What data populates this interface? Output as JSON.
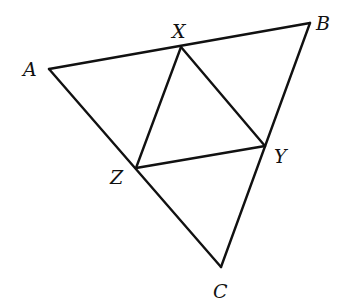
{
  "diagram": {
    "type": "geometry-triangle",
    "stroke_color": "#111111",
    "background": "#ffffff",
    "points": {
      "A": {
        "x": 49,
        "y": 69
      },
      "B": {
        "x": 310,
        "y": 23
      },
      "C": {
        "x": 221,
        "y": 267
      },
      "X": {
        "x": 181,
        "y": 47
      },
      "Y": {
        "x": 265,
        "y": 146
      },
      "Z": {
        "x": 136,
        "y": 168
      }
    },
    "segments": [
      [
        "A",
        "B"
      ],
      [
        "B",
        "C"
      ],
      [
        "C",
        "A"
      ],
      [
        "X",
        "Y"
      ],
      [
        "Y",
        "Z"
      ],
      [
        "Z",
        "X"
      ]
    ],
    "labels": {
      "A": "A",
      "B": "B",
      "C": "C",
      "X": "X",
      "Y": "Y",
      "Z": "Z"
    }
  }
}
